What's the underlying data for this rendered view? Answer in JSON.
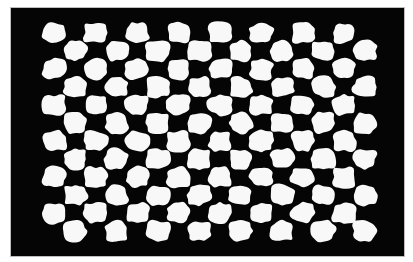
{
  "image": {
    "subject": "distorted black-and-white checkerboard pattern with wavy, blob-like white tiles on a black frame",
    "background_color": "#ffffff",
    "frame_color": "#050505",
    "tile_color": "#f8f8f8"
  },
  "board": {
    "origin_x": 44,
    "origin_y": 24,
    "columns": 16,
    "rows": 12,
    "cell_width": 20.7,
    "cell_height": 18.0,
    "first_cell_white": true
  }
}
